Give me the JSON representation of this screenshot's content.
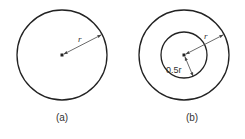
{
  "figures": [
    {
      "id": "a",
      "caption": "(a)",
      "center": [
        62,
        55
      ],
      "outer_radius": 45,
      "radius_label": "r"
    },
    {
      "id": "b",
      "caption": "(b)",
      "center": [
        184,
        55
      ],
      "outer_radius": 45,
      "inner_radius": 23,
      "outer_radius_label": "r",
      "inner_radius_label": "0.5r"
    }
  ],
  "colors": {
    "stroke": "#222222",
    "arrow": "#444444",
    "text": "#333333"
  }
}
